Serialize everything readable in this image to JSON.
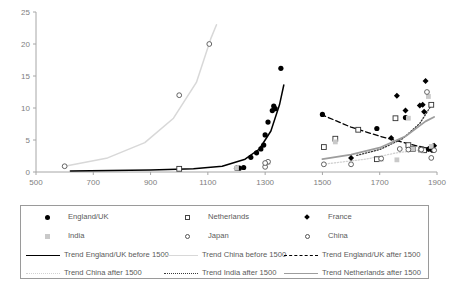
{
  "chart_data": {
    "type": "scatter",
    "title": "",
    "xlabel": "",
    "ylabel": "",
    "xlim": [
      500,
      1900
    ],
    "ylim": [
      0,
      25
    ],
    "x_ticks": [
      500,
      700,
      900,
      1100,
      1300,
      1500,
      1700,
      1900
    ],
    "y_ticks": [
      0,
      5,
      10,
      15,
      20,
      25
    ],
    "grid": false,
    "legend_position": "bottom",
    "series": [
      {
        "name": "England/UK",
        "marker": "circle-filled",
        "color": "#000000",
        "points": [
          [
            1200,
            0.6
          ],
          [
            1210,
            0.6
          ],
          [
            1225,
            0.7
          ],
          [
            1250,
            2.3
          ],
          [
            1270,
            3.0
          ],
          [
            1285,
            3.6
          ],
          [
            1295,
            4.2
          ],
          [
            1300,
            5.8
          ],
          [
            1310,
            7.8
          ],
          [
            1325,
            9.6
          ],
          [
            1330,
            10.3
          ],
          [
            1335,
            9.9
          ],
          [
            1355,
            16.2
          ],
          [
            1500,
            9.0
          ],
          [
            1690,
            6.8
          ],
          [
            1790,
            8.5
          ],
          [
            1860,
            3.5
          ],
          [
            1875,
            3.6
          ],
          [
            1885,
            3.4
          ]
        ]
      },
      {
        "name": "Netherlands",
        "marker": "square-open",
        "color": "#333333",
        "points": [
          [
            1000,
            0.5
          ],
          [
            1505,
            3.9
          ],
          [
            1545,
            5.2
          ],
          [
            1625,
            6.6
          ],
          [
            1690,
            2.0
          ],
          [
            1755,
            8.4
          ],
          [
            1800,
            4.2
          ],
          [
            1815,
            3.6
          ],
          [
            1845,
            3.5
          ],
          [
            1855,
            3.4
          ],
          [
            1880,
            10.5
          ]
        ]
      },
      {
        "name": "France",
        "marker": "diamond-filled",
        "color": "#000000",
        "points": [
          [
            1600,
            2.2
          ],
          [
            1740,
            5.3
          ],
          [
            1760,
            11.9
          ],
          [
            1790,
            9.6
          ],
          [
            1840,
            10.4
          ],
          [
            1850,
            10.5
          ],
          [
            1855,
            9.4
          ],
          [
            1860,
            14.2
          ],
          [
            1870,
            3.6
          ],
          [
            1885,
            4.0
          ],
          [
            1890,
            4.1
          ]
        ]
      },
      {
        "name": "India",
        "marker": "square-gray",
        "color": "#c9c9c9",
        "points": [
          [
            1200,
            0.6
          ],
          [
            1310,
            1.5
          ],
          [
            1545,
            4.7
          ],
          [
            1705,
            2.0
          ],
          [
            1760,
            1.9
          ],
          [
            1800,
            8.4
          ],
          [
            1815,
            3.6
          ],
          [
            1845,
            3.4
          ],
          [
            1870,
            11.8
          ],
          [
            1880,
            4.0
          ]
        ]
      },
      {
        "name": "Japan",
        "marker": "circle-open",
        "color": "#555555",
        "points": [
          [
            1300,
            0.8
          ],
          [
            1310,
            1.6
          ],
          [
            1505,
            1.2
          ],
          [
            1600,
            1.2
          ],
          [
            1705,
            2.1
          ],
          [
            1770,
            3.6
          ],
          [
            1800,
            3.5
          ],
          [
            1845,
            3.5
          ],
          [
            1865,
            12.5
          ],
          [
            1880,
            2.2
          ],
          [
            1890,
            3.4
          ]
        ]
      },
      {
        "name": "China",
        "marker": "circle-open",
        "color": "#555555",
        "points": [
          [
            600,
            0.9
          ],
          [
            1000,
            12.0
          ],
          [
            1105,
            20.0
          ],
          [
            1300,
            1.4
          ]
        ]
      }
    ],
    "trends": [
      {
        "name": "Trend England/UK before 1500",
        "style": "solid",
        "color": "#000000",
        "width": 1.5,
        "path": [
          [
            620,
            0.15
          ],
          [
            900,
            0.3
          ],
          [
            1050,
            0.5
          ],
          [
            1150,
            0.9
          ],
          [
            1230,
            2.0
          ],
          [
            1280,
            3.6
          ],
          [
            1320,
            6.4
          ],
          [
            1350,
            10.5
          ],
          [
            1365,
            13.6
          ]
        ]
      },
      {
        "name": "Trend China before 1500",
        "style": "solid",
        "color": "#d8d8d8",
        "width": 1.5,
        "path": [
          [
            600,
            0.9
          ],
          [
            750,
            2.2
          ],
          [
            880,
            4.6
          ],
          [
            980,
            8.4
          ],
          [
            1060,
            14.0
          ],
          [
            1110,
            20.8
          ],
          [
            1130,
            23.0
          ]
        ]
      },
      {
        "name": "Trend England/UK after 1500",
        "style": "dashed",
        "color": "#000000",
        "width": 1.3,
        "path": [
          [
            1495,
            9.0
          ],
          [
            1600,
            7.0
          ],
          [
            1700,
            5.6
          ],
          [
            1800,
            4.4
          ],
          [
            1895,
            3.4
          ]
        ]
      },
      {
        "name": "Trend China after 1500",
        "style": "dotted",
        "color": "#d2d2d2",
        "width": 1.3,
        "path": [
          [
            1500,
            1.2
          ],
          [
            1650,
            2.0
          ],
          [
            1760,
            3.0
          ],
          [
            1850,
            3.5
          ],
          [
            1895,
            3.7
          ]
        ]
      },
      {
        "name": "Trend India after 1500",
        "style": "dotted",
        "color": "#3a3a3a",
        "width": 1.3,
        "path": [
          [
            1620,
            2.6
          ],
          [
            1700,
            3.5
          ],
          [
            1780,
            5.2
          ],
          [
            1840,
            7.6
          ],
          [
            1880,
            10.4
          ]
        ]
      },
      {
        "name": "Trend Netherlands after 1500",
        "style": "solid",
        "color": "#9d9d9d",
        "width": 1.8,
        "path": [
          [
            1500,
            2.0
          ],
          [
            1600,
            2.7
          ],
          [
            1700,
            3.8
          ],
          [
            1790,
            5.6
          ],
          [
            1860,
            7.9
          ],
          [
            1890,
            8.6
          ]
        ]
      }
    ]
  },
  "legend": {
    "markers": [
      {
        "key": "circle-filled",
        "label": "England/UK"
      },
      {
        "key": "square-open",
        "label": "Netherlands"
      },
      {
        "key": "diamond-filled",
        "label": "France"
      },
      {
        "key": "square-gray",
        "label": "India"
      },
      {
        "key": "circle-open",
        "label": "Japan"
      },
      {
        "key": "circle-open",
        "label": "China"
      }
    ],
    "lines": [
      {
        "key": "solid-black",
        "label": "Trend England/UK before 1500"
      },
      {
        "key": "solid-light",
        "label": "Trend China before 1500"
      },
      {
        "key": "dash-black",
        "label": "Trend England/UK after 1500"
      },
      {
        "key": "dot-light",
        "label": "Trend China after 1500"
      },
      {
        "key": "dot-dark",
        "label": "Trend India after 1500"
      },
      {
        "key": "solid-gray",
        "label": "Trend Netherlands after 1500"
      }
    ]
  },
  "axis": {
    "y_labels": [
      "0",
      "5",
      "10",
      "15",
      "20",
      "25"
    ],
    "x_labels": [
      "500",
      "700",
      "900",
      "1100",
      "1300",
      "1500",
      "1700",
      "1900"
    ]
  }
}
